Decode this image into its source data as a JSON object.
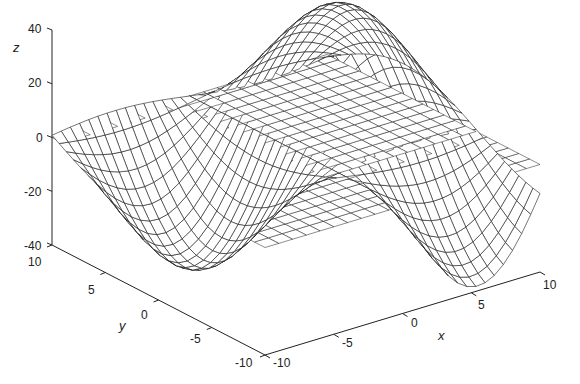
{
  "chart_data": {
    "type": "surface3d",
    "title": "",
    "xlabel": "x",
    "ylabel": "y",
    "zlabel": "z",
    "xlim": [
      -10,
      10
    ],
    "ylim": [
      -10,
      10
    ],
    "zlim": [
      -40,
      40
    ],
    "xticks": [
      -10,
      -5,
      0,
      5,
      10
    ],
    "yticks": [
      -10,
      -5,
      0,
      5,
      10
    ],
    "zticks": [
      -40,
      -20,
      0,
      20,
      40
    ],
    "surface": {
      "description": "Mesh surface with two positive peaks and two negative troughs (saddle-like sinusoidal shape), amplitude about 40, intersected by a flat gridded plane at z = 0",
      "peaks": [
        {
          "x": 6,
          "y": 4,
          "z": 40
        },
        {
          "x": -6,
          "y": 6,
          "z": 22
        }
      ],
      "troughs": [
        {
          "x": 3,
          "y": -6,
          "z": -40
        },
        {
          "x": -4,
          "y": 2,
          "z": -20
        }
      ],
      "grid_lines": 31
    },
    "plane": {
      "z": 0,
      "x_range": [
        -10,
        10
      ],
      "y_range": [
        -10,
        10
      ],
      "grid_lines": 41
    },
    "grid": false,
    "legend": null
  },
  "labels": {
    "z": "z",
    "y": "y",
    "x": "x",
    "z_ticks": [
      "40",
      "20",
      "0",
      "-20",
      "-40"
    ],
    "y_ticks": [
      "10",
      "5",
      "0",
      "-5",
      "-10"
    ],
    "x_ticks": [
      "-10",
      "-5",
      "0",
      "5",
      "10"
    ]
  }
}
